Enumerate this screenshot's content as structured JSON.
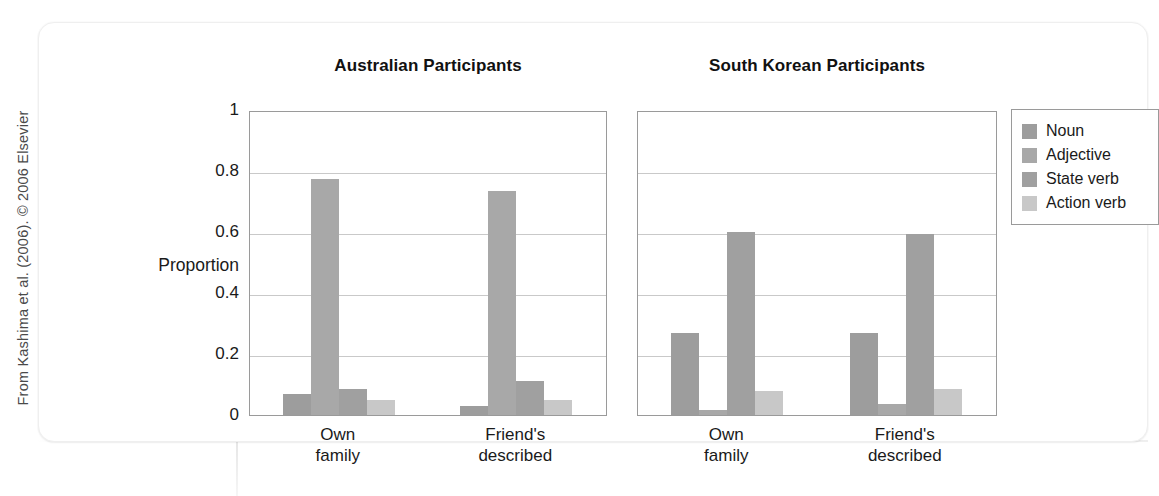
{
  "credit": "From Kashima et al. (2006). © 2006 Elsevier",
  "axis": {
    "y_title": "Proportion",
    "y_ticks": [
      "1",
      "0.8",
      "0.6",
      "0.4",
      "0.2",
      "0"
    ]
  },
  "legend": {
    "items": [
      {
        "label": "Noun",
        "color": "#9d9d9d"
      },
      {
        "label": "Adjective",
        "color": "#a8a8a8"
      },
      {
        "label": "State verb",
        "color": "#a0a0a0"
      },
      {
        "label": "Action verb",
        "color": "#c8c8c8"
      }
    ]
  },
  "panels": [
    {
      "key": "au",
      "title": "Australian Participants"
    },
    {
      "key": "kr",
      "title": "South Korean Participants"
    }
  ],
  "chart_data": {
    "type": "bar",
    "xlabel": "",
    "ylabel": "Proportion",
    "ylim": [
      0,
      1
    ],
    "yticks": [
      0,
      0.2,
      0.4,
      0.6,
      0.8,
      1
    ],
    "grid": true,
    "legend_position": "right-outside",
    "panels": [
      {
        "name": "Australian Participants",
        "categories": [
          "Own family",
          "Friend's described"
        ],
        "series": [
          {
            "name": "Noun",
            "values": [
              0.07,
              0.03
            ]
          },
          {
            "name": "Adjective",
            "values": [
              0.775,
              0.735
            ]
          },
          {
            "name": "State verb",
            "values": [
              0.085,
              0.11
            ]
          },
          {
            "name": "Action verb",
            "values": [
              0.05,
              0.05
            ]
          }
        ]
      },
      {
        "name": "South Korean Participants",
        "categories": [
          "Own family",
          "Friend's described"
        ],
        "series": [
          {
            "name": "Noun",
            "values": [
              0.27,
              0.27
            ]
          },
          {
            "name": "Adjective",
            "values": [
              0.015,
              0.035
            ]
          },
          {
            "name": "State verb",
            "values": [
              0.6,
              0.595
            ]
          },
          {
            "name": "Action verb",
            "values": [
              0.08,
              0.085
            ]
          }
        ]
      }
    ],
    "category_labels_wrapped": [
      [
        "Own",
        "family"
      ],
      [
        "Friend's",
        "described"
      ]
    ]
  }
}
